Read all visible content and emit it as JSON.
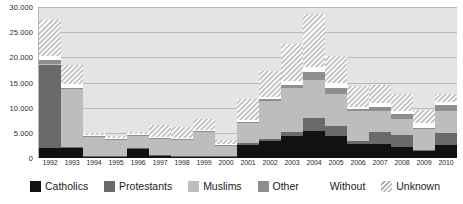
{
  "chart_data": {
    "type": "bar",
    "stacked": true,
    "title": "",
    "subtitle": "",
    "xlabel": "",
    "ylabel": "",
    "ylim": [
      0,
      30000
    ],
    "ytick_labels": [
      "30.000",
      "25.000",
      "20.000",
      "15.000",
      "10.000",
      "5.000",
      "0"
    ],
    "ytick_values": [
      30000,
      25000,
      20000,
      15000,
      10000,
      5000,
      0
    ],
    "grid": true,
    "legend_position": "bottom",
    "categories": [
      "1992",
      "1993",
      "1994",
      "1995",
      "1996",
      "1997",
      "1998",
      "1999",
      "2000",
      "2001",
      "2002",
      "2003",
      "2004",
      "2005",
      "2006",
      "2007",
      "2008",
      "2009",
      "2010"
    ],
    "series": [
      {
        "name": "Catholics",
        "color": "#111111",
        "values": [
          1900,
          1900,
          250,
          250,
          1800,
          400,
          200,
          200,
          200,
          2600,
          3300,
          4300,
          5400,
          4300,
          2700,
          2700,
          2200,
          1300,
          2500
        ]
      },
      {
        "name": "Protestants",
        "color": "#6a6a6a",
        "values": [
          16500,
          300,
          200,
          200,
          200,
          200,
          200,
          200,
          200,
          300,
          500,
          900,
          2500,
          2000,
          600,
          2400,
          2400,
          300,
          2500
        ]
      },
      {
        "name": "Muslims",
        "color": "#bdbdbd",
        "values": [
          300,
          11500,
          3800,
          3200,
          2400,
          3100,
          3100,
          4700,
          2000,
          4000,
          7600,
          8800,
          7600,
          6500,
          6000,
          4200,
          3200,
          4200,
          4300
        ]
      },
      {
        "name": "Other",
        "color": "#8e8e8e",
        "values": [
          800,
          300,
          200,
          200,
          200,
          200,
          200,
          200,
          200,
          300,
          400,
          600,
          1500,
          1200,
          400,
          900,
          900,
          200,
          1200
        ]
      },
      {
        "name": "Without",
        "color": "#ffffff",
        "values": [
          700,
          700,
          200,
          200,
          200,
          200,
          200,
          200,
          200,
          300,
          400,
          700,
          1100,
          900,
          400,
          700,
          700,
          1000,
          700
        ]
      },
      {
        "name": "Unknown",
        "color": "#hatch",
        "values": [
          7300,
          3700,
          300,
          300,
          300,
          2400,
          2300,
          2200,
          700,
          4200,
          5100,
          7400,
          10500,
          5400,
          4200,
          3600,
          3300,
          2500,
          1600
        ]
      }
    ]
  },
  "legend": {
    "items": [
      {
        "label": "Catholics",
        "swatch": "catholics"
      },
      {
        "label": "Protestants",
        "swatch": "protestants"
      },
      {
        "label": "Muslims",
        "swatch": "muslims"
      },
      {
        "label": "Other",
        "swatch": "other"
      },
      {
        "label": "Without",
        "swatch": "without"
      },
      {
        "label": "Unknown",
        "swatch": "unknown"
      }
    ]
  },
  "colors": {
    "plot_background": "#e4e4e4",
    "page_background": "#ffffff",
    "gridline": "#b9b9b9",
    "axis": "#8d8d8d",
    "text": "#2b2b2b"
  }
}
